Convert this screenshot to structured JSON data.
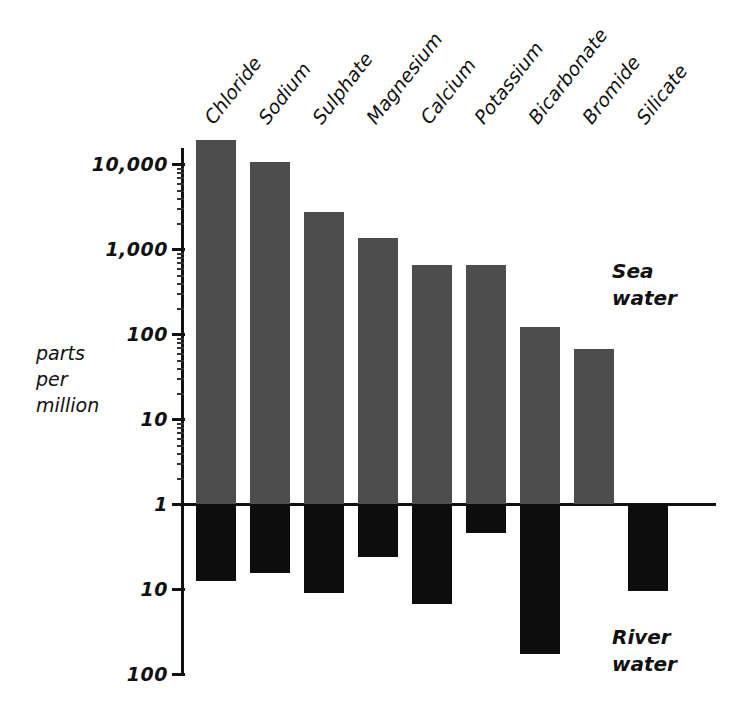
{
  "chart_data": {
    "type": "bar",
    "title": "",
    "xlabel": "",
    "ylabel": "parts per million",
    "ylabel_lines": [
      "parts",
      "per",
      "million"
    ],
    "scale": "log",
    "orientation": "vertical-diverging",
    "grid": false,
    "legend_position": "right",
    "categories": [
      "Chloride",
      "Sodium",
      "Sulphate",
      "Magnesium",
      "Calcium",
      "Potassium",
      "Bicarbonate",
      "Bromide",
      "Silicate"
    ],
    "y_ticks_upper": [
      "10,000",
      "1,000",
      "100",
      "10",
      "1"
    ],
    "y_tick_values_upper": [
      10000,
      1000,
      100,
      10,
      1
    ],
    "y_ticks_lower": [
      "1",
      "10",
      "100"
    ],
    "y_tick_values_lower": [
      1,
      10,
      100
    ],
    "ylim_upper": [
      1,
      30000
    ],
    "ylim_lower": [
      1,
      100
    ],
    "series": [
      {
        "name": "Sea water",
        "direction": "up",
        "color": "#4d4d4d",
        "values": [
          19000,
          10500,
          2700,
          1350,
          640,
          640,
          120,
          66,
          null
        ]
      },
      {
        "name": "River water",
        "direction": "down",
        "color": "#0d0d0d",
        "values": [
          8.0,
          6.5,
          11.0,
          4.2,
          15.0,
          2.2,
          58.0,
          null,
          10.5
        ]
      }
    ]
  },
  "legend": {
    "sea_lines": [
      "Sea",
      "water"
    ],
    "river_lines": [
      "River",
      "water"
    ]
  },
  "colors": {
    "sea_water": "#4d4d4d",
    "river_water": "#0d0d0d",
    "axis": "#111111",
    "background": "#ffffff"
  }
}
